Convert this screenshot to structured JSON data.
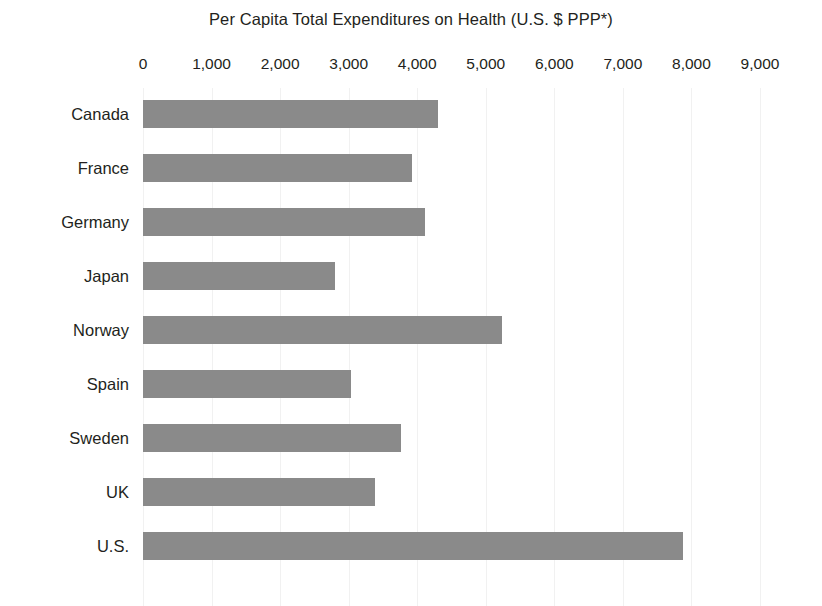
{
  "chart_data": {
    "type": "bar",
    "orientation": "horizontal",
    "title": "Per Capita Total Expenditures on Health (U.S. $ PPP*)",
    "xlabel": "",
    "ylabel": "",
    "xlim": [
      0,
      9000
    ],
    "xticks": [
      0,
      1000,
      2000,
      3000,
      4000,
      5000,
      6000,
      7000,
      8000,
      9000
    ],
    "xtick_labels": [
      "0",
      "1,000",
      "2,000",
      "3,000",
      "4,000",
      "5,000",
      "6,000",
      "7,000",
      "8,000",
      "9,000"
    ],
    "grid": "vertical-only",
    "legend": "none",
    "bar_color": "#8a8a8a",
    "categories": [
      "Canada",
      "France",
      "Germany",
      "Japan",
      "Norway",
      "Spain",
      "Sweden",
      "UK",
      "U.S."
    ],
    "values": [
      4300,
      3920,
      4120,
      2800,
      5230,
      3030,
      3760,
      3380,
      7870
    ],
    "series": [
      {
        "name": "Per capita total expenditures on health",
        "values": [
          4300,
          3920,
          4120,
          2800,
          5230,
          3030,
          3760,
          3380,
          7870
        ]
      }
    ],
    "points": [
      {
        "category": "Canada",
        "value": 4300
      },
      {
        "category": "France",
        "value": 3920
      },
      {
        "category": "Germany",
        "value": 4120
      },
      {
        "category": "Japan",
        "value": 2800
      },
      {
        "category": "Norway",
        "value": 5230
      },
      {
        "category": "Spain",
        "value": 3030
      },
      {
        "category": "Sweden",
        "value": 3760
      },
      {
        "category": "UK",
        "value": 3380
      },
      {
        "category": "U.S.",
        "value": 7870
      }
    ]
  },
  "colors": {
    "bar": "#8a8a8a",
    "grid": "#f1f1f1",
    "text": "#231f20",
    "background": "#ffffff"
  }
}
